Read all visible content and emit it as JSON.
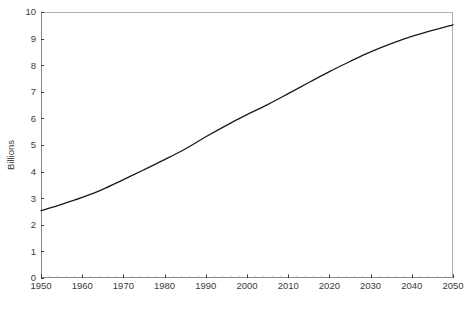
{
  "chart_data": {
    "type": "line",
    "title": "",
    "subtitle": "",
    "xlabel": "",
    "ylabel": "Billions",
    "xlim": [
      1950,
      2050
    ],
    "ylim": [
      0,
      10
    ],
    "grid": false,
    "legend": false,
    "legend_position": "none",
    "line_color": "#1a1a1a",
    "frame_color": "#b0b0b0",
    "tick_label_color": "#3a3a3a",
    "background_color": "#ffffff",
    "xticks": [
      1950,
      1960,
      1970,
      1980,
      1990,
      2000,
      2010,
      2020,
      2030,
      2040,
      2050
    ],
    "xtick_labels": [
      "1950",
      "1960",
      "1970",
      "1980",
      "1990",
      "2000",
      "2010",
      "2020",
      "2030",
      "2040",
      "2050"
    ],
    "yticks": [
      0,
      1,
      2,
      3,
      4,
      5,
      6,
      7,
      8,
      9,
      10
    ],
    "ytick_labels": [
      "0",
      "1",
      "2",
      "3",
      "4",
      "5",
      "6",
      "7",
      "8",
      "9",
      "10"
    ],
    "x_minor_tick_interval": 2,
    "series": [
      {
        "name": "World population",
        "x": [
          1950,
          1955,
          1960,
          1965,
          1970,
          1975,
          1980,
          1985,
          1990,
          1995,
          2000,
          2005,
          2010,
          2015,
          2020,
          2025,
          2030,
          2035,
          2040,
          2045,
          2050
        ],
        "values": [
          2.53,
          2.77,
          3.03,
          3.33,
          3.7,
          4.07,
          4.45,
          4.85,
          5.31,
          5.74,
          6.14,
          6.52,
          6.93,
          7.35,
          7.76,
          8.14,
          8.5,
          8.81,
          9.08,
          9.31,
          9.52
        ]
      }
    ],
    "annotations": []
  }
}
